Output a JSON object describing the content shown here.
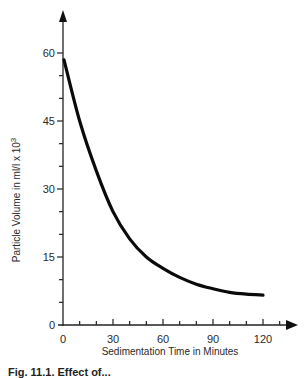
{
  "chart_data": {
    "type": "line",
    "title": "",
    "xlabel": "Sedimentation Time in Minutes",
    "ylabel": "Particle Volume in ml/l x 10^3",
    "ylabel_base": "Particle Volume in ml/l x 10",
    "ylabel_exp": "3",
    "xlim": [
      0,
      130
    ],
    "ylim": [
      0,
      65
    ],
    "x_ticks": [
      0,
      30,
      60,
      90,
      120
    ],
    "x_tick_labels": [
      "0",
      "30",
      "60",
      "90",
      "120"
    ],
    "x_minor_step": 10,
    "y_ticks": [
      0,
      15,
      30,
      45,
      60
    ],
    "y_tick_labels": [
      "0",
      "15",
      "30",
      "45",
      "60"
    ],
    "y_minor_step": 5,
    "grid": false,
    "legend": null,
    "series": [
      {
        "name": "Particle volume",
        "x": [
          0,
          10,
          20,
          30,
          40,
          50,
          60,
          70,
          80,
          90,
          100,
          110,
          120
        ],
        "values": [
          58.5,
          45,
          34,
          25,
          19,
          15,
          12.5,
          10.5,
          9,
          8,
          7.2,
          6.8,
          6.6
        ]
      }
    ]
  },
  "caption": "Fig. 11.1. Effect of..."
}
